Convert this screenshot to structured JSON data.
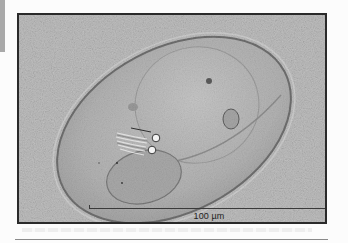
{
  "figure": {
    "scale_bar": {
      "label": "100 µm",
      "value": 100,
      "unit": "µm"
    },
    "colors": {
      "background": "#b8b8b8",
      "frame": "#2a2a2a",
      "organism_outline": "#6a6a6a",
      "organism_body": "#bdbdbd"
    }
  }
}
